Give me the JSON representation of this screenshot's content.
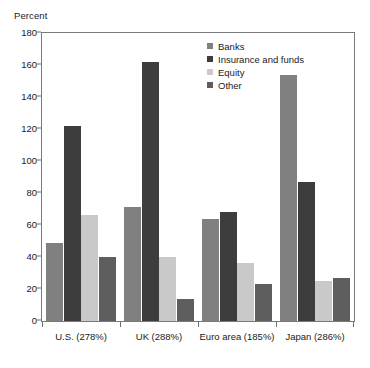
{
  "chart_data": {
    "type": "bar",
    "title": "",
    "subtitle": "",
    "xlabel": "",
    "ylabel": "Percent",
    "ylim": [
      0,
      180
    ],
    "yticks": [
      0,
      20,
      40,
      60,
      80,
      100,
      120,
      140,
      160,
      180
    ],
    "ytick_labels": [
      "0",
      "20",
      "40",
      "60",
      "80",
      "100",
      "120",
      "140",
      "160",
      "180"
    ],
    "grid": false,
    "legend_position": "top-right",
    "categories": [
      "U.S. (278%)",
      "UK (288%)",
      "Euro area (185%)",
      "Japan (286%)"
    ],
    "series": [
      {
        "name": "Banks",
        "color": "#808080",
        "values": [
          49,
          71,
          64,
          154
        ]
      },
      {
        "name": "Insurance and funds",
        "color": "#3d3d3d",
        "values": [
          122,
          162,
          68,
          87
        ]
      },
      {
        "name": "Equity",
        "color": "#c9c9c9",
        "values": [
          66,
          40,
          36,
          25
        ]
      },
      {
        "name": "Other",
        "color": "#5e5e5e",
        "values": [
          40,
          14,
          23,
          27
        ]
      }
    ]
  },
  "legend": {
    "items": [
      {
        "label": "Banks"
      },
      {
        "label": "Insurance and funds"
      },
      {
        "label": "Equity"
      },
      {
        "label": "Other"
      }
    ]
  },
  "axes": {
    "y_unit_label": "Percent"
  },
  "colors": {
    "banks": "#808080",
    "insurance_and_funds": "#3d3d3d",
    "equity": "#c9c9c9",
    "other": "#5e5e5e",
    "axis": "#7a7a7a",
    "background": "#ffffff",
    "text": "#1a1a1a"
  }
}
